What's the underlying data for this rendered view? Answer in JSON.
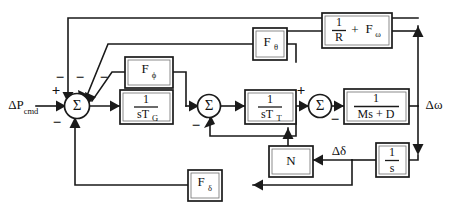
{
  "diagram": {
    "background_color": "#ffffff",
    "line_color": "#1a1a1a",
    "inputs": [
      {
        "id": "p-cmd",
        "label_main": "ΔP",
        "label_sub": "cmd",
        "sign": "+"
      }
    ],
    "outputs": [
      {
        "id": "delta-omega",
        "label": "Δω"
      },
      {
        "id": "delta-delta",
        "label": "Δδ"
      }
    ],
    "blocks": [
      {
        "id": "f-phi",
        "label_main": "F",
        "label_sub": "ϕ",
        "kind": "gain"
      },
      {
        "id": "governor",
        "numerator": "1",
        "denominator_main": "sT",
        "denominator_sub": "G",
        "kind": "transfer"
      },
      {
        "id": "turbine",
        "numerator": "1",
        "denominator_main": "sT",
        "denominator_sub": "T",
        "kind": "transfer"
      },
      {
        "id": "inertia",
        "numerator": "1",
        "denominator": "Ms + D",
        "kind": "transfer"
      },
      {
        "id": "f-theta",
        "label_main": "F",
        "label_sub": "θ",
        "kind": "gain"
      },
      {
        "id": "droop",
        "numerator": "1",
        "denominator": "R",
        "suffix_op": "+",
        "suffix_main": "F",
        "suffix_sub": "ω",
        "kind": "gain"
      },
      {
        "id": "integrator",
        "numerator": "1",
        "denominator": "s",
        "kind": "transfer"
      },
      {
        "id": "n-block",
        "label_main": "N",
        "kind": "gain"
      },
      {
        "id": "f-delta",
        "label_main": "F",
        "label_sub": "δ",
        "kind": "gain"
      }
    ],
    "summing_junctions": [
      {
        "id": "sum-1",
        "symbol": "Σ",
        "signs": [
          {
            "port": "left",
            "sign": "+"
          },
          {
            "port": "top-left",
            "sign": "−"
          },
          {
            "port": "top-mid",
            "sign": "−"
          },
          {
            "port": "top-right",
            "sign": "−"
          },
          {
            "port": "bottom",
            "sign": "−"
          }
        ]
      },
      {
        "id": "sum-2",
        "symbol": "Σ",
        "signs": [
          {
            "port": "bottom",
            "sign": "−"
          }
        ]
      },
      {
        "id": "sum-3",
        "symbol": "Σ",
        "signs": [
          {
            "port": "left",
            "sign": "+"
          },
          {
            "port": "bottom",
            "sign": "−"
          }
        ]
      }
    ],
    "signs": {
      "plus": "+",
      "minus": "−"
    }
  }
}
